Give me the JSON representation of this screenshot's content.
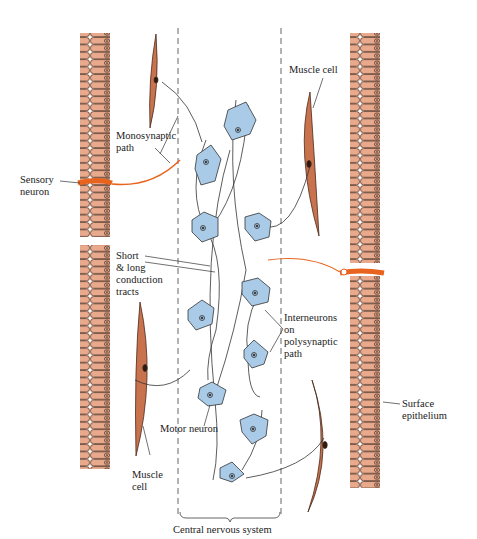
{
  "diagram": {
    "title": "Central nervous system",
    "colors": {
      "epithelium_fill": "#e9a98c",
      "epithelium_stroke": "#5a3a2a",
      "muscle_fill": "#c8734e",
      "neuron_fill": "#a9cbe8",
      "sensory_neuron": "#e8641e",
      "axon": "#333333",
      "cns_border": "#555555"
    },
    "labels": {
      "monosynaptic": "Monosynaptic\npath",
      "sensory_neuron": "Sensory\nneuron",
      "muscle_cell_top": "Muscle cell",
      "short_long": "Short\n& long\nconduction\ntracts",
      "interneurons": "Interneurons\non\npolysynaptic\npath",
      "motor_neuron": "Motor neuron",
      "muscle_cell_bottom": "Muscle\ncell",
      "surface_epithelium": "Surface\nepithelium",
      "cns": "Central nervous system"
    }
  }
}
